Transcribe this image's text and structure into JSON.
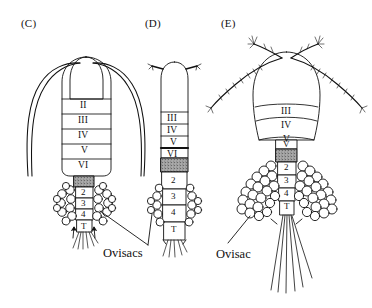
{
  "figure": {
    "background_color": "#ffffff",
    "ink_color": "#111111",
    "stipple_color": "#9a9a9a"
  },
  "panels": [
    {
      "id": "C",
      "label": "(C)",
      "description": "Broad dorsal view with long smooth antennae sweeping to both sides and paired lateral ovisacs",
      "antennae": "long-smooth-curved",
      "prosome_segments": [
        "II",
        "III",
        "IV",
        "V",
        "VI"
      ],
      "genital_block": "stippled",
      "urosome_segments": [
        "2",
        "3",
        "4",
        "T"
      ],
      "ovisac_count": 2,
      "ovisac_style": "paired-lateral-small",
      "caudal_setae": "short-splayed"
    },
    {
      "id": "D",
      "label": "(D)",
      "description": "Narrow elongate body with short angled antennae and small paired ovisacs",
      "antennae": "short-angled",
      "prosome_segments": [
        "III",
        "IV",
        "V",
        "VI"
      ],
      "genital_block": "stippled",
      "urosome_segments": [
        "2",
        "3",
        "4",
        "T"
      ],
      "ovisac_count": 2,
      "ovisac_style": "paired-lateral-small",
      "caudal_setae": "short-splayed"
    },
    {
      "id": "E",
      "label": "(E)",
      "description": "Large bulbous body with long feathered antennae and two large drooping ovisac lobes",
      "antennae": "long-feathered",
      "prosome_segments": [
        "III",
        "IV",
        "V"
      ],
      "narrow_segment": "V",
      "genital_block": "stippled",
      "urosome_segments": [
        "2",
        "3",
        "4",
        "T"
      ],
      "ovisac_count": 2,
      "ovisac_style": "paired-large-drooping",
      "caudal_setae": "long-straight"
    }
  ],
  "callouts": [
    {
      "id": "ovisacs",
      "text": "Ovisacs",
      "points_to": [
        "C",
        "D"
      ]
    },
    {
      "id": "ovisac",
      "text": "Ovisac",
      "points_to": [
        "E"
      ]
    }
  ]
}
